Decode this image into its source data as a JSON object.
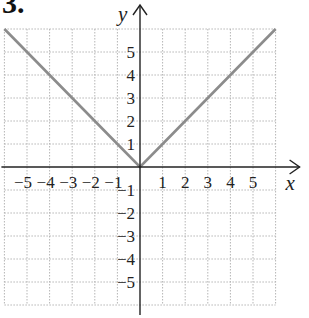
{
  "problem_number": "3.",
  "chart_data": {
    "type": "line",
    "title": "",
    "function": "y = |x|",
    "xlabel": "x",
    "ylabel": "y",
    "xlim": [
      -6,
      6
    ],
    "ylim": [
      -6,
      6
    ],
    "grid": true,
    "grid_style": "dotted",
    "x_tick_labels": [
      "-5",
      "-4",
      "-3",
      "-2",
      "-1",
      "1",
      "2",
      "3",
      "4",
      "5"
    ],
    "y_tick_labels": [
      "5",
      "4",
      "3",
      "2",
      "1",
      "-1",
      "-2",
      "-3",
      "-4",
      "-5"
    ],
    "series": [
      {
        "name": "y = |x|",
        "color": "#8c8c8c",
        "x": [
          -6,
          -5,
          -4,
          -3,
          -2,
          -1,
          0,
          1,
          2,
          3,
          4,
          5,
          6
        ],
        "y": [
          6,
          5,
          4,
          3,
          2,
          1,
          0,
          1,
          2,
          3,
          4,
          5,
          6
        ]
      }
    ],
    "colors": {
      "axis": "#222222",
      "grid": "#b5b5b5",
      "line": "#8c8c8c"
    }
  }
}
